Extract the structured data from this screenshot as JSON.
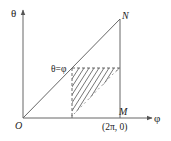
{
  "diagram": {
    "type": "integration-region",
    "axes": {
      "x_label": "φ",
      "y_label": "θ"
    },
    "points": {
      "origin": "O",
      "top_right": "N",
      "bottom_right": "M",
      "bottom_right_coord": "(2π, 0)"
    },
    "annotations": {
      "diagonal_label": "θ=φ"
    },
    "colors": {
      "line": "#555555",
      "text": "#222222",
      "background": "#ffffff"
    }
  }
}
